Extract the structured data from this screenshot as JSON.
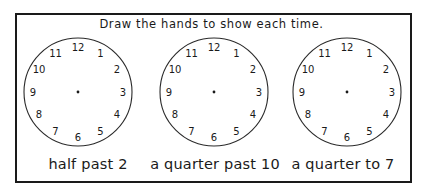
{
  "worksheet": {
    "title": "Draw the hands to show each time.",
    "clocks": [
      {
        "label": "half past 2",
        "numerals": [
          "12",
          "1",
          "2",
          "3",
          "4",
          "5",
          "6",
          "7",
          "8",
          "9",
          "10",
          "11"
        ]
      },
      {
        "label": "a quarter past 10",
        "numerals": [
          "12",
          "1",
          "2",
          "3",
          "4",
          "5",
          "6",
          "7",
          "8",
          "9",
          "10",
          "11"
        ]
      },
      {
        "label": "a quarter to 7",
        "numerals": [
          "12",
          "1",
          "2",
          "3",
          "4",
          "5",
          "6",
          "7",
          "8",
          "9",
          "10",
          "11"
        ]
      }
    ]
  },
  "colors": {
    "ink": "#1a1a1a",
    "paper": "#ffffff"
  }
}
